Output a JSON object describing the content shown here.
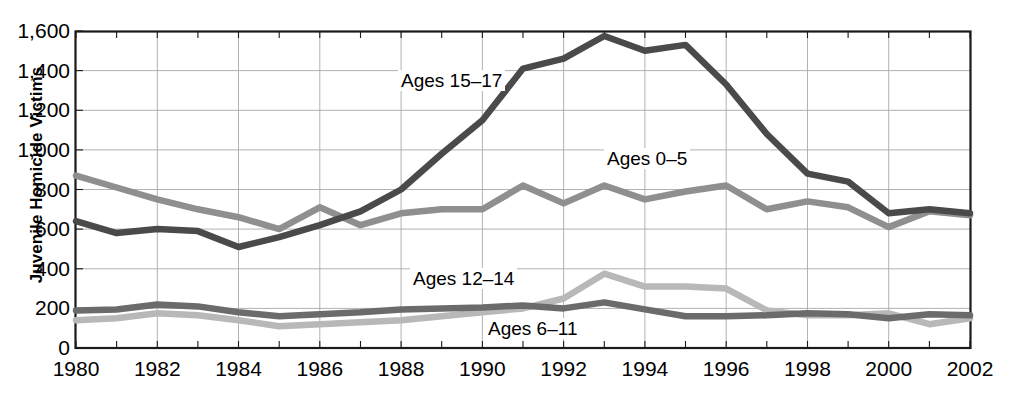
{
  "chart_data": {
    "type": "line",
    "title": "",
    "xlabel": "",
    "ylabel": "Juvenile Homicide Victims",
    "xlim": [
      1980,
      2002
    ],
    "ylim": [
      0,
      1600
    ],
    "grid": true,
    "legend_position": "inline-annotations",
    "x": [
      1980,
      1981,
      1982,
      1983,
      1984,
      1985,
      1986,
      1987,
      1988,
      1989,
      1990,
      1991,
      1992,
      1993,
      1994,
      1995,
      1996,
      1997,
      1998,
      1999,
      2000,
      2001,
      2002
    ],
    "y_ticks": [
      0,
      200,
      400,
      600,
      800,
      1000,
      1200,
      1400,
      1600
    ],
    "y_tick_labels": [
      "0",
      "200",
      "400",
      "600",
      "800",
      "1,000",
      "1,200",
      "1,400",
      "1,600"
    ],
    "x_ticks": [
      1980,
      1981,
      1982,
      1983,
      1984,
      1985,
      1986,
      1987,
      1988,
      1989,
      1990,
      1991,
      1992,
      1993,
      1994,
      1995,
      1996,
      1997,
      1998,
      1999,
      2000,
      2001,
      2002
    ],
    "x_tick_labels_shown": [
      "1980",
      "1982",
      "1984",
      "1986",
      "1988",
      "1990",
      "1992",
      "1994",
      "1996",
      "1998",
      "2000",
      "2002"
    ],
    "series": [
      {
        "name": "Ages 15–17",
        "label": "Ages 15–17",
        "color": "#4a4a4a",
        "label_x": 398,
        "label_y": 70,
        "values": [
          640,
          580,
          600,
          590,
          510,
          560,
          620,
          690,
          800,
          980,
          1150,
          1410,
          1460,
          1575,
          1500,
          1530,
          1330,
          1080,
          880,
          840,
          680,
          700,
          680
        ]
      },
      {
        "name": "Ages 0–5",
        "label": "Ages 0–5",
        "color": "#8f8f8f",
        "label_x": 604,
        "label_y": 148,
        "values": [
          870,
          810,
          750,
          700,
          660,
          600,
          710,
          620,
          680,
          700,
          700,
          820,
          730,
          820,
          750,
          790,
          820,
          700,
          740,
          710,
          610,
          690,
          670
        ]
      },
      {
        "name": "Ages 12–14",
        "label": "Ages 12–14",
        "color": "#b8b8b8",
        "label_x": 410,
        "label_y": 268,
        "values": [
          140,
          150,
          175,
          165,
          140,
          110,
          120,
          130,
          140,
          160,
          180,
          200,
          250,
          375,
          310,
          310,
          300,
          190,
          165,
          165,
          175,
          120,
          150
        ]
      },
      {
        "name": "Ages 6–11",
        "label": "Ages 6–11",
        "color": "#6b6b6b",
        "label_x": 485,
        "label_y": 318,
        "values": [
          190,
          195,
          220,
          210,
          180,
          160,
          170,
          180,
          195,
          200,
          205,
          215,
          200,
          230,
          195,
          160,
          160,
          165,
          175,
          170,
          150,
          170,
          165
        ]
      }
    ]
  },
  "axes": {
    "y_title": "Juvenile Homicide Victims"
  }
}
